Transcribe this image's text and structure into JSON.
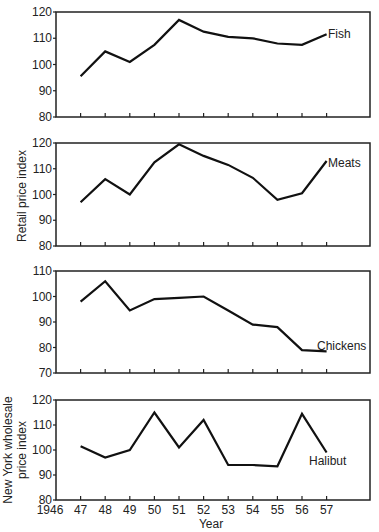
{
  "chart_data": [
    {
      "type": "line",
      "title": "",
      "series_label": "Fish",
      "x": [
        1947,
        1948,
        1949,
        1950,
        1951,
        1952,
        1953,
        1954,
        1955,
        1956,
        1957
      ],
      "series": [
        {
          "name": "Fish",
          "values": [
            95.5,
            105,
            101,
            107.5,
            117,
            112.5,
            110.5,
            110,
            108,
            107.5,
            111.5
          ]
        }
      ],
      "ylim": [
        80,
        120
      ],
      "yticks": [
        80,
        90,
        100,
        110,
        120
      ],
      "ylabel": "",
      "xlabel": ""
    },
    {
      "type": "line",
      "series_label": "Meats",
      "x": [
        1947,
        1948,
        1949,
        1950,
        1951,
        1952,
        1953,
        1954,
        1955,
        1956,
        1957
      ],
      "series": [
        {
          "name": "Meats",
          "values": [
            97,
            106,
            100,
            112.5,
            119.5,
            115,
            111.5,
            106.5,
            98,
            100.5,
            113
          ]
        }
      ],
      "ylim": [
        80,
        120
      ],
      "yticks": [
        80,
        90,
        100,
        110,
        120
      ],
      "ylabel": "Retail price index",
      "xlabel": ""
    },
    {
      "type": "line",
      "series_label": "Chickens",
      "x": [
        1947,
        1948,
        1949,
        1950,
        1951,
        1952,
        1953,
        1954,
        1955,
        1956,
        1957
      ],
      "series": [
        {
          "name": "Chickens",
          "values": [
            98,
            106,
            94.5,
            99,
            99.5,
            100,
            94.5,
            89,
            88,
            79,
            78.5
          ]
        }
      ],
      "ylim": [
        70,
        110
      ],
      "yticks": [
        70,
        80,
        90,
        100,
        110
      ],
      "ylabel": "",
      "xlabel": ""
    },
    {
      "type": "line",
      "series_label": "Halibut",
      "x": [
        1947,
        1948,
        1949,
        1950,
        1951,
        1952,
        1953,
        1954,
        1955,
        1956,
        1957
      ],
      "series": [
        {
          "name": "Halibut",
          "values": [
            101.5,
            97,
            100,
            115,
            101,
            112,
            94,
            94,
            93.5,
            114.5,
            99
          ]
        }
      ],
      "ylim": [
        80,
        120
      ],
      "yticks": [
        80,
        90,
        100,
        110,
        120
      ],
      "ylabel": "New York wholesale price index",
      "xlabel": "Year"
    }
  ],
  "axis": {
    "x_tick_labels": [
      "1946",
      "47",
      "48",
      "49",
      "50",
      "51",
      "52",
      "53",
      "54",
      "55",
      "56",
      "57"
    ],
    "x_title": "Year",
    "retail_ylabel": "Retail price index",
    "wholesale_ylabel_line1": "New York wholesale",
    "wholesale_ylabel_line2": "price index"
  },
  "labels": {
    "fish": "Fish",
    "meats": "Meats",
    "chickens": "Chickens",
    "halibut": "Halibut"
  }
}
